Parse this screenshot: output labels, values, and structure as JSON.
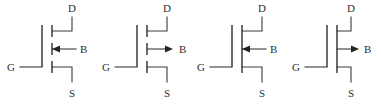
{
  "figure": {
    "background_color": "#ffffff",
    "line_color": "#3a3a3a",
    "label_color": "#2e2e2e",
    "symbol_count": 4
  },
  "labels": {
    "drain": "D",
    "source": "S",
    "gate": "G",
    "body": "B"
  },
  "symbols": [
    {
      "index": 1,
      "name": "n-channel-enhancement-mosfet",
      "channel_style": "broken",
      "body_arrow_direction": "left",
      "terminals": {
        "drain": "D",
        "source": "S",
        "gate": "G",
        "body": "B"
      }
    },
    {
      "index": 2,
      "name": "p-channel-enhancement-mosfet",
      "channel_style": "broken",
      "body_arrow_direction": "right",
      "terminals": {
        "drain": "D",
        "source": "S",
        "gate": "G",
        "body": "B"
      }
    },
    {
      "index": 3,
      "name": "n-channel-depletion-mosfet",
      "channel_style": "solid",
      "body_arrow_direction": "left",
      "terminals": {
        "drain": "D",
        "source": "S",
        "gate": "G",
        "body": "B"
      }
    },
    {
      "index": 4,
      "name": "p-channel-depletion-mosfet",
      "channel_style": "solid",
      "body_arrow_direction": "right",
      "terminals": {
        "drain": "D",
        "source": "S",
        "gate": "G",
        "body": "B"
      }
    }
  ],
  "geometry": {
    "symbol_origins_x": [
      0,
      95,
      190,
      285
    ],
    "gate_bar_x": 42,
    "channel_x": 52,
    "drain_stub_y": 31,
    "body_stub_y": 49,
    "source_stub_y": 67,
    "rail_x": 72,
    "drain_top_y": 17,
    "source_bottom_y": 82,
    "gate_lead_y": 67,
    "gate_lead_left_x": 20
  }
}
